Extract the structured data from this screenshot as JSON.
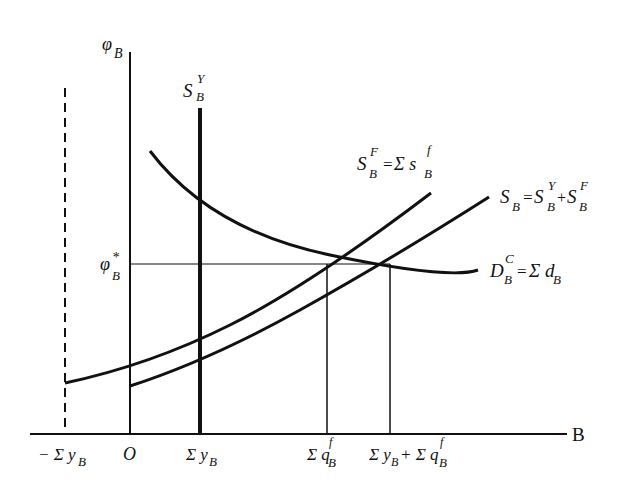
{
  "diagram": {
    "type": "supply-demand",
    "axes": {
      "y_label": {
        "main": "φ",
        "sub": "B"
      },
      "x_label": "B",
      "origin_label": "O"
    },
    "curves": [
      {
        "id": "S_B_Y",
        "label": {
          "main": "S",
          "sub": "B",
          "sup": "Y"
        },
        "kind": "vertical-supply"
      },
      {
        "id": "S_B_F",
        "label": {
          "main": "S",
          "sub": "B",
          "sup": "F",
          "eq": "=",
          "rhs": "Σ s",
          "rhs_sub": "B",
          "rhs_sup": "f"
        },
        "kind": "upward-supply"
      },
      {
        "id": "S_B",
        "label": {
          "main": "S",
          "sub": "B",
          "eq": "=",
          "t1": "S",
          "t1_sub": "B",
          "t1_sup": "Y",
          "plus": "+",
          "t2": "S",
          "t2_sub": "B",
          "t2_sup": "F"
        },
        "kind": "total-supply"
      },
      {
        "id": "D_B_C",
        "label": {
          "main": "D",
          "sub": "B",
          "sup": "C",
          "eq": "=",
          "rhs": "Σ d",
          "rhs_sub": "B"
        },
        "kind": "demand"
      }
    ],
    "equilibrium_price": {
      "main": "φ",
      "sub": "B",
      "sup": "*"
    },
    "x_ticks": [
      {
        "text": "− Σ y",
        "sub": "B"
      },
      {
        "text": "O"
      },
      {
        "text": "Σ y",
        "sub": "B"
      },
      {
        "text": "Σ q",
        "sub": "B",
        "sup": "f"
      },
      {
        "text": "Σ y",
        "sub": "B",
        "mid": "+ Σ q",
        "sub2": "B",
        "sup2": "f"
      }
    ]
  }
}
